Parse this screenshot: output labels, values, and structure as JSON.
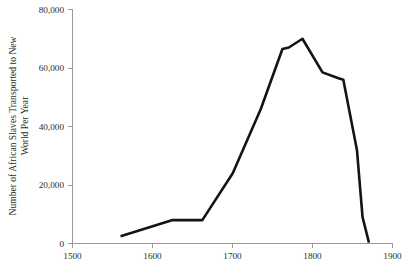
{
  "chart_data": {
    "type": "line",
    "title": "",
    "subtitle": "",
    "xlabel": "",
    "ylabel": "Number of African Slaves Transported to New World Per Year",
    "ylabel_line1": "Number of African Slaves Transported to New",
    "ylabel_line2": "World Per Year",
    "xlim": [
      1500,
      1900
    ],
    "ylim": [
      0,
      80000
    ],
    "grid": false,
    "legend": false,
    "legend_position": "none",
    "line_color": "#141414",
    "axis_color": "#9a9a9a",
    "x_ticks": [
      1500,
      1600,
      1700,
      1800,
      1900
    ],
    "x_tick_labels": [
      "1500",
      "1600",
      "1700",
      "1800",
      "1900"
    ],
    "y_ticks": [
      0,
      20000,
      40000,
      60000,
      80000
    ],
    "y_tick_labels": [
      "0",
      "20,000",
      "40,000",
      "60,000",
      "80,000"
    ],
    "series": [
      {
        "name": "Slaves transported per year",
        "x": [
          1560,
          1625,
          1662,
          1700,
          1735,
          1762,
          1770,
          1787,
          1812,
          1832,
          1838,
          1855,
          1862,
          1870
        ],
        "values": [
          2500,
          8000,
          8000,
          24000,
          46000,
          66500,
          67000,
          70000,
          58500,
          56500,
          56000,
          32000,
          9000,
          300
        ]
      }
    ]
  }
}
